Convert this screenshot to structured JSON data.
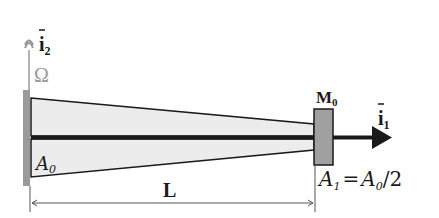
{
  "diagram": {
    "type": "tapered cantilever beam",
    "labels": {
      "axis_vertical": "i",
      "axis_vertical_sub": "2",
      "axis_horizontal": "i",
      "axis_horizontal_sub": "1",
      "domain": "Ω",
      "root_area": "A",
      "root_area_sub": "0",
      "tip_area_lhs": "A",
      "tip_area_lhs_sub": "1",
      "tip_area_eq": "=",
      "tip_area_rhs": "A",
      "tip_area_rhs_sub": "0",
      "tip_area_rhs_tail": "/2",
      "tip_mass": "M",
      "tip_mass_sub": "0",
      "length": "L"
    },
    "colors": {
      "beam_fill": "#ececec",
      "outline": "#1a1a1a",
      "wall": "#9a9a9a",
      "mass_block": "#a0a0a0",
      "axis_gray": "#9a9a9a"
    }
  }
}
